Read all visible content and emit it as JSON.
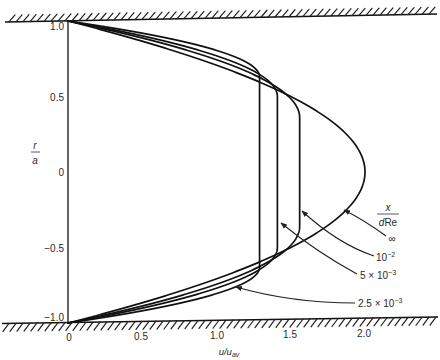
{
  "chart_data": {
    "type": "line",
    "title": "",
    "xlabel": "u/u_av",
    "ylabel": "r/a",
    "xlabel_parts": {
      "main": "u/u",
      "sub": "av"
    },
    "ylabel_parts": {
      "num": "r",
      "den": "a"
    },
    "xlim": [
      0,
      2.3
    ],
    "ylim": [
      -1.0,
      1.0
    ],
    "xticks": [
      "0",
      "0.5",
      "1.0",
      "1.5",
      "2.0"
    ],
    "yticks": [
      "1.0",
      "0.5",
      "0",
      "−0.5",
      "−1.0"
    ],
    "grid": false,
    "legend_title": "x/(dRe)",
    "legend_title_parts": {
      "num": "x",
      "den_italic": "d",
      "den_roman": "Re"
    },
    "legend_position": "right, with leader arrows to curves",
    "annotations": [
      "Hatched pipe walls at r/a = +1 and r/a = −1"
    ],
    "r": [
      1.0,
      0.9,
      0.8,
      0.7,
      0.6,
      0.5,
      0.4,
      0.3,
      0.2,
      0.1,
      0.0,
      -0.1,
      -0.2,
      -0.3,
      -0.4,
      -0.5,
      -0.6,
      -0.7,
      -0.8,
      -0.9,
      -1.0
    ],
    "series": [
      {
        "name": "∞",
        "label_main": "∞",
        "label_exp": "",
        "u_center": 2.0,
        "core_radius": 0.0,
        "values": [
          0,
          0.38,
          0.72,
          1.02,
          1.28,
          1.5,
          1.68,
          1.82,
          1.92,
          1.98,
          2.0,
          1.98,
          1.92,
          1.82,
          1.68,
          1.5,
          1.28,
          1.02,
          0.72,
          0.38,
          0
        ]
      },
      {
        "name": "10^-2",
        "label_main": "10",
        "label_exp": "−2",
        "u_center": 1.56,
        "core_radius": 0.36,
        "values": [
          0,
          0.45,
          0.82,
          1.12,
          1.34,
          1.48,
          1.55,
          1.56,
          1.56,
          1.56,
          1.56,
          1.56,
          1.56,
          1.56,
          1.55,
          1.48,
          1.34,
          1.12,
          0.82,
          0.45,
          0
        ]
      },
      {
        "name": "5 x 10^-3",
        "label_main": "5 × 10",
        "label_exp": "−3",
        "u_center": 1.41,
        "core_radius": 0.5,
        "values": [
          0,
          0.51,
          0.91,
          1.19,
          1.36,
          1.41,
          1.41,
          1.41,
          1.41,
          1.41,
          1.41,
          1.41,
          1.41,
          1.41,
          1.41,
          1.41,
          1.36,
          1.19,
          0.91,
          0.51,
          0
        ]
      },
      {
        "name": "2.5 x 10^-3",
        "label_main": "2.5 × 10",
        "label_exp": "−3",
        "u_center": 1.29,
        "core_radius": 0.63,
        "values": [
          0,
          0.6,
          1.01,
          1.24,
          1.29,
          1.29,
          1.29,
          1.29,
          1.29,
          1.29,
          1.29,
          1.29,
          1.29,
          1.29,
          1.29,
          1.29,
          1.29,
          1.24,
          1.01,
          0.6,
          0
        ]
      }
    ]
  }
}
